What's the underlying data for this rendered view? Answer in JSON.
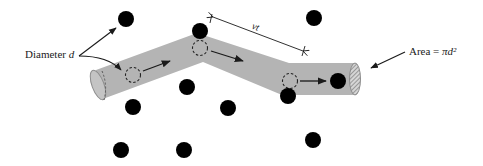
{
  "diagram": {
    "labels": {
      "diameter_text": "Diameter",
      "diameter_var": "d",
      "distance_label": "vt",
      "area_text": "Area =",
      "area_formula": "πd²"
    },
    "colors": {
      "tube": "#b4b4b4",
      "tube_edge": "#8c8c8c",
      "molecule": "#000000",
      "arrow": "#1a1a1a",
      "cap_hatch": "#7a7a7a"
    },
    "molecules": [
      {
        "x": 126,
        "y": 19
      },
      {
        "x": 200,
        "y": 31
      },
      {
        "x": 314,
        "y": 18
      },
      {
        "x": 187,
        "y": 87
      },
      {
        "x": 133,
        "y": 107
      },
      {
        "x": 228,
        "y": 108
      },
      {
        "x": 288,
        "y": 96
      },
      {
        "x": 338,
        "y": 81
      },
      {
        "x": 121,
        "y": 150
      },
      {
        "x": 184,
        "y": 150
      },
      {
        "x": 313,
        "y": 140
      }
    ],
    "moving_molecule_positions": [
      {
        "x": 133,
        "y": 75
      },
      {
        "x": 200,
        "y": 48
      },
      {
        "x": 290,
        "y": 81
      }
    ]
  }
}
